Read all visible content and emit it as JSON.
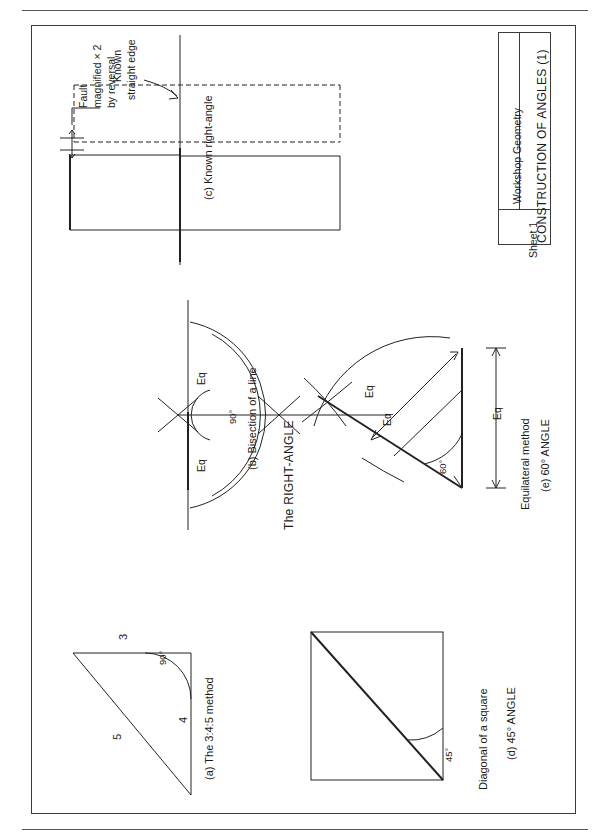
{
  "sheet": {
    "orientation": "landscape-rotated-text"
  },
  "title_block": {
    "course": "Workshop Geometry",
    "drawing_title": "CONSTRUCTION OF ANGLES (1)",
    "sheet_number": "Sheet 1"
  },
  "headings": {
    "right_angle": "The RIGHT-ANGLE"
  },
  "figures": [
    {
      "id": "a",
      "caption": "(a) The 3:4:5 method",
      "labels": {
        "side_top": "3",
        "side_vertical": "4",
        "hypotenuse": "5",
        "angle": "90°"
      }
    },
    {
      "id": "b",
      "caption": "(b) Bisection of a line",
      "labels": {
        "arc_upper": "Eq",
        "arc_lower": "Eq",
        "angle": "90°"
      }
    },
    {
      "id": "c",
      "caption": "(c) Known right-angle",
      "labels": {
        "fault_note": "Fault\nmagnified × 2\nby reversal",
        "fault_note_l1": "Fault",
        "fault_note_l2": "magnified × 2",
        "fault_note_l3": "by reversal",
        "edge_note_l1": "Known",
        "edge_note_l2": "straight edge"
      }
    },
    {
      "id": "d",
      "caption": "(d) 45° ANGLE",
      "subcaption": "Diagonal of a square",
      "labels": {
        "angle": "45°"
      }
    },
    {
      "id": "e",
      "caption": "(e) 60° ANGLE",
      "subcaption": "Equilateral method",
      "labels": {
        "arc_outer": "Eq",
        "arc_inner": "Eq",
        "base": "Eq",
        "angle": "60°"
      }
    }
  ]
}
